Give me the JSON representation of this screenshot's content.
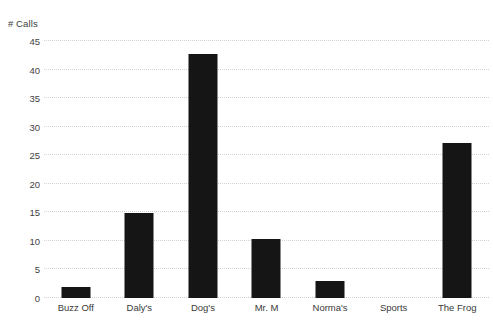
{
  "chart_data": {
    "type": "bar",
    "title": "",
    "subtitle": "",
    "xlabel": "",
    "ylabel": "# Calls",
    "categories": [
      "Buzz Off",
      "Daly's",
      "Dog's",
      "Mr. M",
      "Norma's",
      "Sports",
      "The Frog"
    ],
    "values": [
      2,
      14.8,
      42.7,
      10.3,
      3,
      0,
      27.1
    ],
    "series": [
      {
        "name": "# Calls",
        "values": [
          2,
          14.8,
          42.7,
          10.3,
          3,
          0,
          27.1
        ]
      }
    ],
    "ylim": [
      0,
      45
    ],
    "ytick_labels": [
      "0",
      "5",
      "10",
      "15",
      "20",
      "25",
      "30",
      "35",
      "40",
      "45"
    ],
    "ytick_values": [
      0,
      5,
      10,
      15,
      20,
      25,
      30,
      35,
      40,
      45
    ],
    "grid": true,
    "grid_axis": "y",
    "grid_style": "dotted",
    "legend": false,
    "legend_position": "none",
    "bar_color": "#151515",
    "grid_color": "#d4d4d4",
    "text_color": "#3a3a3a",
    "background_color": "#ffffff",
    "annotations": []
  },
  "axis": {
    "y_title": "# Calls"
  }
}
